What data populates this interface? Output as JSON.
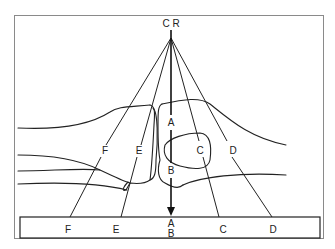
{
  "diagram": {
    "source_label": "C R",
    "central_ray_labels": {
      "top": "A",
      "bottom": "B"
    },
    "ray_labels": {
      "F": "F",
      "E": "E",
      "C": "C",
      "D": "D"
    },
    "receptor_labels": {
      "F": "F",
      "E": "E",
      "A": "A",
      "B": "B",
      "C": "C",
      "D": "D"
    }
  }
}
